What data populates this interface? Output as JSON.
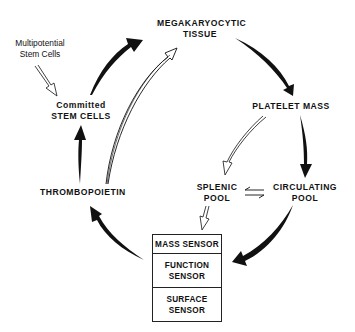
{
  "diagram": {
    "type": "cycle",
    "nodes": {
      "megakaryocytic_tissue": {
        "line1": "MEGAKARYOCYTIC",
        "line2": "TISSUE"
      },
      "multipotential": {
        "line1": "Multipotential",
        "line2": "Stem Cells"
      },
      "committed": {
        "line1": "Committed",
        "line2": "STEM CELLS"
      },
      "platelet_mass": {
        "line1": "PLATELET MASS"
      },
      "thrombopoietin": {
        "line1": "THROMBOPOIETIN"
      },
      "splenic_pool": {
        "line1": "SPLENIC",
        "line2": "POOL"
      },
      "circulating_pool": {
        "line1": "CIRCULATING",
        "line2": "POOL"
      }
    },
    "sensor_box": {
      "mass": {
        "line1": "MASS SENSOR"
      },
      "function": {
        "line1": "FUNCTION",
        "line2": "SENSOR"
      },
      "surface": {
        "line1": "SURFACE",
        "line2": "SENSOR"
      }
    },
    "edges": [
      {
        "from": "Multipotential Stem Cells",
        "to": "Committed STEM CELLS",
        "style": "hollow"
      },
      {
        "from": "Committed STEM CELLS",
        "to": "MEGAKARYOCYTIC TISSUE",
        "style": "solid"
      },
      {
        "from": "THROMBOPOIETIN",
        "to": "MEGAKARYOCYTIC TISSUE",
        "style": "hollow"
      },
      {
        "from": "MEGAKARYOCYTIC TISSUE",
        "to": "PLATELET MASS",
        "style": "solid"
      },
      {
        "from": "PLATELET MASS",
        "to": "CIRCULATING POOL",
        "style": "solid"
      },
      {
        "from": "PLATELET MASS",
        "to": "SPLENIC POOL",
        "style": "hollow"
      },
      {
        "from": "SPLENIC POOL",
        "to": "CIRCULATING POOL",
        "style": "equilibrium"
      },
      {
        "from": "SPLENIC POOL",
        "to": "Sensor box",
        "style": "hollow"
      },
      {
        "from": "CIRCULATING POOL",
        "to": "Sensor box",
        "style": "solid"
      },
      {
        "from": "Sensor box",
        "to": "THROMBOPOIETIN",
        "style": "solid"
      },
      {
        "from": "THROMBOPOIETIN",
        "to": "Committed STEM CELLS",
        "style": "solid"
      }
    ],
    "colors": {
      "ink": "#111111",
      "background": "#ffffff"
    }
  }
}
